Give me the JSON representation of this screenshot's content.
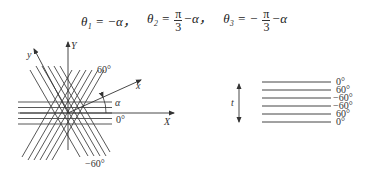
{
  "formula": {
    "theta1": {
      "lhs": "θ₁",
      "eq": "=",
      "rhs": "−α"
    },
    "theta2": {
      "lhs": "θ₂",
      "eq": "=",
      "num": "π",
      "den": "3",
      "rest": "−α"
    },
    "theta3": {
      "lhs": "θ₃",
      "eq": "=",
      "sign": "−",
      "num": "π",
      "den": "3",
      "rest": "−α"
    },
    "separator": "，"
  },
  "left_diagram": {
    "axis_X_label": "X",
    "axis_Y_label": "Y",
    "rotated_x_label": "x",
    "rotated_y_label": "y",
    "angle_label": "α",
    "ply_labels": {
      "p60": "60°",
      "p0": "0°",
      "pm60": "−60°"
    }
  },
  "right_diagram": {
    "thickness_label": "t",
    "stack": [
      "0°",
      "60°",
      "−60°",
      "−60°",
      "60°",
      "0°"
    ]
  }
}
